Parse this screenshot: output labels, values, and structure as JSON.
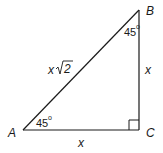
{
  "diagram": {
    "type": "right-triangle",
    "vertices": [
      {
        "id": "A",
        "label": "A"
      },
      {
        "id": "B",
        "label": "B"
      },
      {
        "id": "C",
        "label": "C"
      }
    ],
    "sides": {
      "hypotenuse_var": "x",
      "hypotenuse_radicand": "2",
      "vertical": "x",
      "horizontal": "x"
    },
    "angles": {
      "A": "45",
      "B": "45",
      "degree_symbol": "o"
    },
    "right_angle_at": "C",
    "colors": {
      "stroke": "#1a1a1a",
      "background": "#ffffff"
    }
  }
}
